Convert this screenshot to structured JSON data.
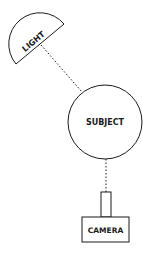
{
  "diagram": {
    "nodes": {
      "light": {
        "label": "LIGHT",
        "shape": "half-circle"
      },
      "subject": {
        "label": "SUBJECT",
        "shape": "circle"
      },
      "camera": {
        "label": "CAMERA",
        "shape": "box-with-lens"
      }
    },
    "edges": [
      {
        "from": "light",
        "to": "subject",
        "style": "dotted"
      },
      {
        "from": "subject",
        "to": "camera",
        "style": "dotted"
      }
    ],
    "colors": {
      "stroke": "#1a1a1a",
      "background": "#ffffff"
    }
  }
}
